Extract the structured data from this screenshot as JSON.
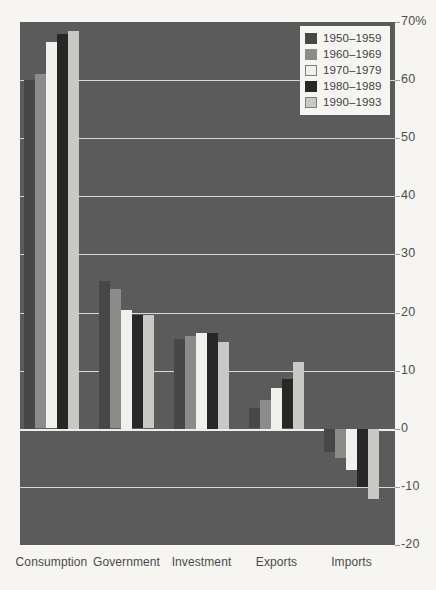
{
  "chart_data": {
    "type": "bar",
    "title": "",
    "subtitle": "",
    "xlabel": "",
    "ylabel": "",
    "categories": [
      "Consumption",
      "Government",
      "Investment",
      "Exports",
      "Imports"
    ],
    "ylim": [
      -20,
      70
    ],
    "ytick_labels": [
      "70%",
      "60",
      "50",
      "40",
      "30",
      "20",
      "10",
      "0",
      "-10",
      "-20"
    ],
    "ytick_values": [
      70,
      60,
      50,
      40,
      30,
      20,
      10,
      0,
      -10,
      -20
    ],
    "grid": true,
    "legend_position": "top-right",
    "series": [
      {
        "name": "1950–1959",
        "color": "#474747",
        "values": [
          60.0,
          25.5,
          15.5,
          3.5,
          -4.0
        ]
      },
      {
        "name": "1960–1969",
        "color": "#8b8b89",
        "values": [
          61.0,
          24.0,
          16.0,
          5.0,
          -5.0
        ]
      },
      {
        "name": "1970–1979",
        "color": "#f1f0ec",
        "values": [
          66.5,
          20.5,
          16.5,
          7.0,
          -7.0
        ]
      },
      {
        "name": "1980–1989",
        "color": "#272727",
        "values": [
          68.0,
          19.5,
          16.5,
          8.5,
          -10.0
        ]
      },
      {
        "name": "1990–1993",
        "color": "#c9c8c4",
        "values": [
          68.5,
          19.5,
          15.0,
          11.5,
          -12.0
        ]
      }
    ],
    "colors": {
      "plot_background": "#5b5b5b",
      "page_background": "#f6f5f2",
      "gridline": "#d8d8d4",
      "zero_line": "#efeeea",
      "axis_text": "#4a4a4a"
    }
  },
  "legend": {
    "items": [
      {
        "label": "1950–1959"
      },
      {
        "label": "1960–1969"
      },
      {
        "label": "1970–1979"
      },
      {
        "label": "1980–1989"
      },
      {
        "label": "1990–1993"
      }
    ]
  }
}
